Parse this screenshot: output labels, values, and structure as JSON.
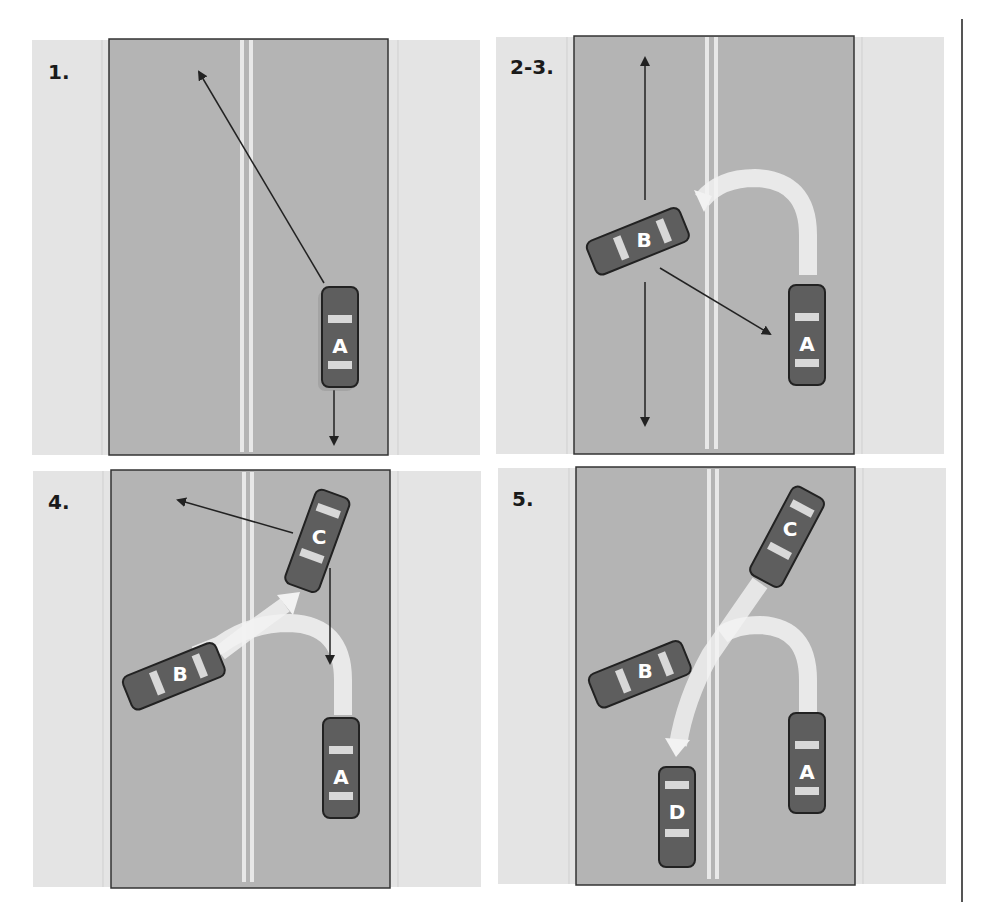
{
  "figure": {
    "panels": [
      {
        "id": "p1",
        "label": "1.",
        "cars": [
          "A"
        ]
      },
      {
        "id": "p2",
        "label": "2-3.",
        "cars": [
          "B",
          "A"
        ]
      },
      {
        "id": "p3",
        "label": "4.",
        "cars": [
          "C",
          "B",
          "A"
        ]
      },
      {
        "id": "p4",
        "label": "5.",
        "cars": [
          "C",
          "B",
          "D",
          "A"
        ]
      }
    ],
    "colors": {
      "shoulder": "#e4e4e4",
      "road": "#b4b4b4",
      "road_border": "#333333",
      "lane_line": "#e8e8e8",
      "car_body": "#5e5e5e",
      "car_outline": "#222222",
      "arrow": "#222222",
      "path_trail": "#f2f2f2"
    }
  }
}
